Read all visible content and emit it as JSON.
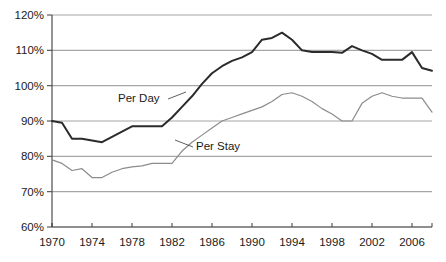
{
  "chart_data": {
    "type": "line",
    "title": "",
    "subtitle": "",
    "xlabel": "",
    "ylabel": "",
    "grid": true,
    "grid_axis": "y",
    "legend_position": "inline-annotations",
    "xlim": [
      1970,
      2008
    ],
    "ylim": [
      60,
      120
    ],
    "y_tick_labels": [
      "120%",
      "110%",
      "100%",
      "90%",
      "80%",
      "70%",
      "60%"
    ],
    "y_tick_values": [
      120,
      110,
      100,
      90,
      80,
      70,
      60
    ],
    "x_tick_labels": [
      "1970",
      "1974",
      "1978",
      "1982",
      "1986",
      "1990",
      "1994",
      "1998",
      "2002",
      "2006"
    ],
    "x_tick_values": [
      1970,
      1974,
      1978,
      1982,
      1986,
      1990,
      1994,
      1998,
      2002,
      2006
    ],
    "x": [
      1970,
      1971,
      1972,
      1973,
      1974,
      1975,
      1976,
      1977,
      1978,
      1979,
      1980,
      1981,
      1982,
      1983,
      1984,
      1985,
      1986,
      1987,
      1988,
      1989,
      1990,
      1991,
      1992,
      1993,
      1994,
      1995,
      1996,
      1997,
      1998,
      1999,
      2000,
      2001,
      2002,
      2003,
      2004,
      2005,
      2006,
      2007,
      2008
    ],
    "series": [
      {
        "name": "Per Day",
        "color": "#2b2b2b",
        "line_width": 2.0,
        "values": [
          90.0,
          89.5,
          85.0,
          85.0,
          84.5,
          84.0,
          85.5,
          87.0,
          88.5,
          88.5,
          88.5,
          88.5,
          91.0,
          94.0,
          97.0,
          100.5,
          103.5,
          105.5,
          107.0,
          108.0,
          109.5,
          113.0,
          113.5,
          115.0,
          113.0,
          110.0,
          109.5,
          109.5,
          109.5,
          109.3,
          111.2,
          110.0,
          109.0,
          107.3,
          107.3,
          107.3,
          109.5,
          105.0,
          104.2
        ]
      },
      {
        "name": "Per Stay",
        "color": "#8c8c8c",
        "line_width": 1.2,
        "values": [
          79.0,
          78.0,
          76.0,
          76.5,
          74.0,
          74.0,
          75.5,
          76.5,
          77.0,
          77.3,
          78.0,
          78.0,
          78.0,
          81.5,
          84.0,
          86.0,
          88.0,
          90.0,
          91.0,
          92.0,
          93.0,
          94.0,
          95.5,
          97.5,
          98.0,
          97.0,
          95.5,
          93.5,
          92.0,
          90.0,
          90.0,
          95.0,
          97.0,
          98.0,
          97.0,
          96.5,
          96.5,
          96.5,
          92.5
        ]
      }
    ],
    "annotations": [
      {
        "name": "Per Day",
        "label": "Per Day",
        "label_x": 118,
        "label_y": 102,
        "leader_from_x": 168,
        "leader_from_y": 99,
        "leader_to_x": 186,
        "leader_to_y": 92
      },
      {
        "name": "Per Stay",
        "label": "Per Stay",
        "label_x": 196,
        "label_y": 150,
        "leader_from_x": 193,
        "leader_from_y": 147,
        "leader_to_x": 175,
        "leader_to_y": 140
      }
    ],
    "colors": {
      "per_day_line": "#2b2b2b",
      "per_stay_line": "#8c8c8c",
      "gridline": "#a6a6a6",
      "axis": "#4d4d4d",
      "background": "#ffffff",
      "text": "#1a1a1a"
    },
    "geometry": {
      "plot_left": 52,
      "plot_right": 432,
      "plot_top": 15,
      "plot_bottom": 227
    }
  }
}
